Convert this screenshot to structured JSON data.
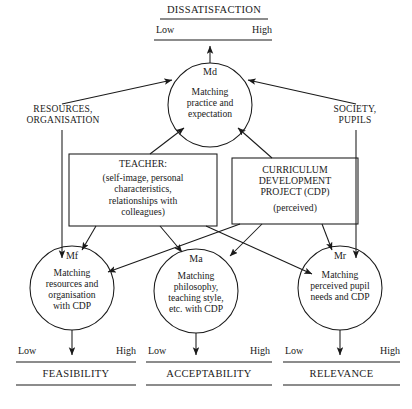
{
  "diagram": {
    "top_scale": {
      "name": "DISSATISFACTION",
      "low": "Low",
      "high": "High"
    },
    "bottom_scales": [
      {
        "name": "FEASIBILITY",
        "low": "Low",
        "high": "High"
      },
      {
        "name": "ACCEPTABILITY",
        "low": "Low",
        "high": "High"
      },
      {
        "name": "RELEVANCE",
        "low": "Low",
        "high": "High"
      }
    ],
    "side_labels": {
      "left": "RESOURCES,\nORGANISATION",
      "right": "SOCIETY,\nPUPILS"
    },
    "circles": [
      {
        "code": "Md",
        "text": "Matching\npractice and\nexpectation"
      },
      {
        "code": "Mf",
        "text": "Matching\nresources and\norganisation\nwith CDP"
      },
      {
        "code": "Ma",
        "text": "Matching\nphilosophy,\nteaching style,\netc. with CDP"
      },
      {
        "code": "Mr",
        "text": "Matching\nperceived pupil\nneeds and CDP"
      }
    ],
    "boxes": [
      {
        "head": "TEACHER:",
        "text": "(self-image, personal\ncharacteristics,\nrelationships with\ncolleagues)"
      },
      {
        "head": "CURRICULUM\nDEVELOPMENT\nPROJECT (CDP)",
        "text": "(perceived)"
      }
    ],
    "colors": {
      "stroke": "#1a1a1a",
      "background": "#ffffff"
    }
  }
}
